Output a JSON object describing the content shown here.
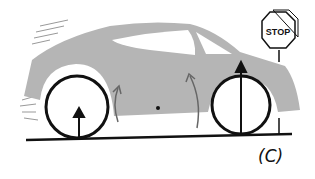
{
  "figure": {
    "caption": "(C)",
    "sign_text": "STOP",
    "colors": {
      "body": "#b5b5b5",
      "ink": "#111111",
      "window": "#ffffff"
    }
  }
}
